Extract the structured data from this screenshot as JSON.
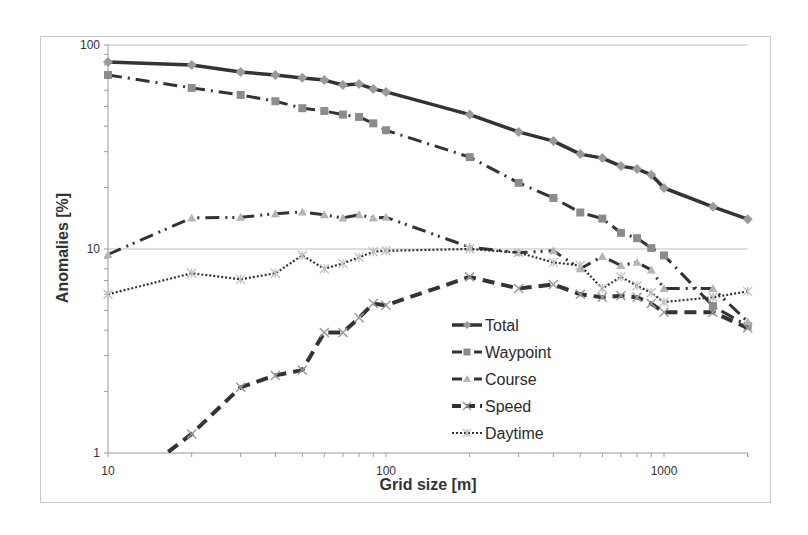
{
  "chart_data": {
    "type": "line",
    "title": "",
    "xlabel": "Grid size [m]",
    "ylabel": "Anomalies [%]",
    "xscale": "log",
    "yscale": "log",
    "xlim": [
      10,
      2000
    ],
    "ylim": [
      1,
      100
    ],
    "x_ticks": [
      10,
      100,
      1000
    ],
    "x_tick_labels": [
      "10",
      "100",
      "1000"
    ],
    "y_ticks": [
      1,
      10,
      100
    ],
    "y_tick_labels": [
      "1",
      "10",
      "100"
    ],
    "grid": "horizontal major",
    "legend_position": "inside lower center",
    "x": [
      10,
      20,
      30,
      40,
      50,
      60,
      70,
      80,
      90,
      100,
      200,
      300,
      400,
      500,
      600,
      700,
      800,
      900,
      1000,
      1500,
      2000
    ],
    "series": [
      {
        "name": "Total",
        "style": "solid",
        "marker": "diamond",
        "color": "#333333",
        "marker_color": "#9a9a9a",
        "values": [
          82.6,
          79.8,
          73.7,
          71.3,
          69.0,
          67.3,
          63.7,
          64.3,
          60.9,
          58.9,
          45.6,
          37.5,
          33.8,
          29.2,
          27.9,
          25.5,
          24.7,
          23.1,
          19.9,
          16.1,
          14.0
        ]
      },
      {
        "name": "Waypoint",
        "style": "dashdot",
        "marker": "square",
        "color": "#333333",
        "marker_color": "#8c8c8c",
        "values": [
          71.3,
          61.6,
          56.9,
          53.0,
          49.0,
          47.5,
          45.6,
          44.4,
          41.3,
          38.2,
          28.2,
          21.1,
          17.8,
          15.1,
          14.1,
          12.0,
          11.3,
          10.1,
          9.3,
          5.25,
          4.2
        ]
      },
      {
        "name": "Course",
        "style": "dashdotdot",
        "marker": "triangle",
        "color": "#333333",
        "marker_color": "#b5b5b5",
        "values": [
          9.4,
          14.2,
          14.3,
          14.9,
          15.2,
          14.7,
          14.2,
          14.7,
          14.2,
          14.3,
          10.2,
          9.6,
          9.8,
          8.0,
          9.2,
          8.3,
          8.6,
          7.9,
          6.4,
          6.4,
          4.4
        ]
      },
      {
        "name": "Speed",
        "style": "dash",
        "marker": "x",
        "color": "#333333",
        "marker_color": "#9a9a9a",
        "values": [
          0.6,
          1.24,
          2.1,
          2.4,
          2.55,
          3.9,
          3.9,
          4.6,
          5.4,
          5.3,
          7.3,
          6.4,
          6.7,
          6.0,
          5.8,
          5.9,
          5.8,
          5.4,
          4.9,
          4.9,
          4.1
        ]
      },
      {
        "name": "Daytime",
        "style": "dotted",
        "marker": "star",
        "color": "#333333",
        "marker_color": "#c0c0c0",
        "values": [
          6.0,
          7.6,
          7.1,
          7.6,
          9.3,
          8.0,
          8.5,
          9.1,
          9.7,
          9.8,
          10.0,
          9.6,
          8.6,
          8.3,
          6.4,
          7.3,
          6.6,
          6.1,
          5.5,
          5.8,
          6.2
        ]
      }
    ]
  },
  "colors": {
    "frame": "#c8c8c8",
    "gridline": "#bdbdbd",
    "axis": "#9a9a9a",
    "line": "#333333"
  }
}
